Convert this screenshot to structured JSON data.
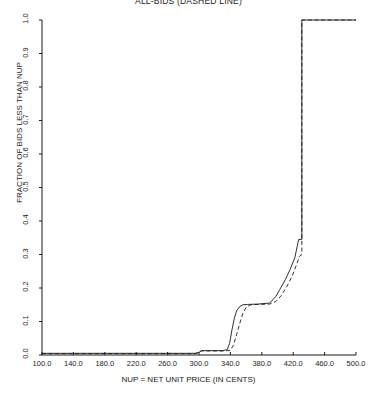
{
  "chart_data": {
    "type": "line",
    "title": "ALL-BIDS (DASHED LINE)",
    "xlabel": "NUP = NET UNIT PRICE (IN CENTS)",
    "ylabel": "FRACTION OF BIDS LESS THAN NUP",
    "xlim": [
      100.0,
      500.0
    ],
    "ylim": [
      0.0,
      1.0
    ],
    "grid": false,
    "legend": "none",
    "xticks": [
      "100.0",
      "140.0",
      "180.0",
      "220.0",
      "260.0",
      "300.0",
      "340.0",
      "380.0",
      "420.0",
      "460.0",
      "500.0"
    ],
    "xtick_values": [
      100,
      140,
      180,
      220,
      260,
      300,
      340,
      380,
      420,
      460,
      500
    ],
    "yticks": [
      "0.0",
      "0.1",
      "0.2",
      "0.3",
      "0.4",
      "0.5",
      "0.6",
      "0.7",
      "0.8",
      "0.9",
      "1.0"
    ],
    "ytick_values": [
      0.0,
      0.1,
      0.2,
      0.3,
      0.4,
      0.5,
      0.6,
      0.7,
      0.8,
      0.9,
      1.0
    ],
    "line_color": "#1a1a1a",
    "series": [
      {
        "name": "WINNING-BIDS (SOLID LINE)",
        "style": "solid",
        "x": [
          100,
          250,
          295,
          300,
          303,
          330,
          336,
          339,
          342,
          345,
          348,
          352,
          356,
          362,
          375,
          390,
          398,
          404,
          410,
          416,
          422,
          427,
          430,
          431,
          431,
          500
        ],
        "values": [
          0.005,
          0.005,
          0.005,
          0.008,
          0.013,
          0.013,
          0.016,
          0.035,
          0.075,
          0.11,
          0.132,
          0.145,
          0.15,
          0.151,
          0.152,
          0.155,
          0.175,
          0.2,
          0.225,
          0.255,
          0.29,
          0.345,
          0.345,
          0.345,
          1.0,
          1.0
        ]
      },
      {
        "name": "ALL-BIDS (DASHED LINE)",
        "style": "dashed",
        "x": [
          100,
          250,
          295,
          300,
          303,
          333,
          340,
          344,
          348,
          352,
          356,
          360,
          366,
          375,
          390,
          398,
          405,
          412,
          418,
          424,
          428,
          431,
          431,
          460,
          500
        ],
        "values": [
          0.004,
          0.004,
          0.004,
          0.007,
          0.012,
          0.012,
          0.014,
          0.03,
          0.062,
          0.095,
          0.125,
          0.142,
          0.15,
          0.151,
          0.152,
          0.16,
          0.178,
          0.205,
          0.232,
          0.268,
          0.295,
          0.3,
          1.0,
          1.0,
          1.0
        ]
      }
    ]
  }
}
